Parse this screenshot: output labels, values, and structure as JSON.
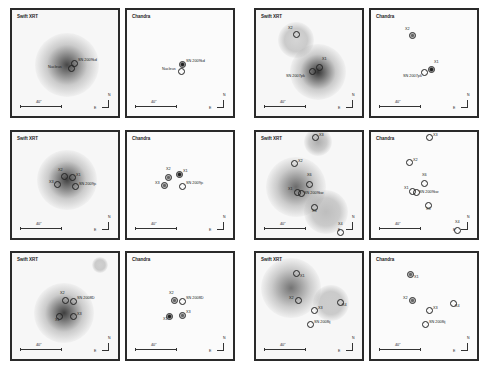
{
  "figure": {
    "scale_label": "40\"",
    "compass": {
      "north": "N",
      "east": "E"
    },
    "panels": [
      {
        "id": "p1",
        "title": "Swift XRT",
        "type": "xrt",
        "x": 10,
        "y": 8,
        "blobs": [
          {
            "x": 55,
            "y": 55,
            "r": 32,
            "c": "rgba(40,40,40,0.85)"
          }
        ],
        "sources": [
          {
            "label": "SN 2009kd",
            "x": 62,
            "y": 53,
            "style": "open",
            "lx": 66,
            "ly": 51
          },
          {
            "label": "Nucleus",
            "x": 59,
            "y": 58,
            "style": "open",
            "lx": 36,
            "ly": 58
          }
        ]
      },
      {
        "id": "p2",
        "title": "Chandra",
        "type": "chandra",
        "x": 125,
        "y": 8,
        "blobs": [],
        "sources": [
          {
            "label": "SN 2009kd",
            "x": 55,
            "y": 54,
            "style": "filled",
            "lx": 59,
            "ly": 52
          },
          {
            "label": "Nucleus",
            "x": 54,
            "y": 61,
            "style": "open",
            "lx": 35,
            "ly": 60
          }
        ]
      },
      {
        "id": "p3",
        "title": "Swift XRT",
        "type": "xrt",
        "x": 254,
        "y": 8,
        "blobs": [
          {
            "x": 62,
            "y": 62,
            "r": 28,
            "c": "rgba(30,30,30,0.9)"
          },
          {
            "x": 40,
            "y": 30,
            "r": 18,
            "c": "rgba(150,150,150,0.35)"
          }
        ],
        "sources": [
          {
            "label": "X2",
            "x": 40,
            "y": 24,
            "style": "open",
            "lx": 32,
            "ly": 19
          },
          {
            "label": "X1",
            "x": 63,
            "y": 57,
            "style": "open",
            "lx": 66,
            "ly": 50
          },
          {
            "label": "SN 2007pk",
            "x": 56,
            "y": 61,
            "style": "open",
            "lx": 30,
            "ly": 67
          }
        ]
      },
      {
        "id": "p4",
        "title": "Chandra",
        "type": "chandra",
        "x": 369,
        "y": 8,
        "blobs": [],
        "sources": [
          {
            "label": "X2",
            "x": 41,
            "y": 25,
            "style": "half",
            "lx": 34,
            "ly": 20
          },
          {
            "label": "X1",
            "x": 60,
            "y": 59,
            "style": "filled",
            "lx": 63,
            "ly": 53
          },
          {
            "label": "SN 2007pk",
            "x": 53,
            "y": 62,
            "style": "open",
            "lx": 32,
            "ly": 67
          }
        ]
      },
      {
        "id": "p5",
        "title": "Swift XRT",
        "type": "xrt",
        "x": 10,
        "y": 130,
        "blobs": [
          {
            "x": 55,
            "y": 48,
            "r": 30,
            "c": "rgba(35,35,35,0.85)"
          }
        ],
        "sources": [
          {
            "label": "X2",
            "x": 52,
            "y": 44,
            "style": "open",
            "lx": 46,
            "ly": 39
          },
          {
            "label": "X1",
            "x": 60,
            "y": 45,
            "style": "open",
            "lx": 64,
            "ly": 44
          },
          {
            "label": "X3",
            "x": 45,
            "y": 52,
            "style": "open",
            "lx": 37,
            "ly": 51
          },
          {
            "label": "SN 2009jc",
            "x": 63,
            "y": 54,
            "style": "open",
            "lx": 67,
            "ly": 53
          }
        ]
      },
      {
        "id": "p6",
        "title": "Chandra",
        "type": "chandra",
        "x": 125,
        "y": 130,
        "blobs": [],
        "sources": [
          {
            "label": "X2",
            "x": 41,
            "y": 45,
            "style": "half",
            "lx": 39,
            "ly": 38
          },
          {
            "label": "X1",
            "x": 52,
            "y": 42,
            "style": "filled",
            "lx": 56,
            "ly": 40
          },
          {
            "label": "X3",
            "x": 37,
            "y": 53,
            "style": "half",
            "lx": 28,
            "ly": 52
          },
          {
            "label": "SN 2009jc",
            "x": 55,
            "y": 54,
            "style": "open",
            "lx": 59,
            "ly": 52
          }
        ]
      },
      {
        "id": "p7",
        "title": "Swift XRT",
        "type": "xrt",
        "x": 254,
        "y": 130,
        "blobs": [
          {
            "x": 40,
            "y": 55,
            "r": 30,
            "c": "rgba(60,60,60,0.75)"
          },
          {
            "x": 62,
            "y": 10,
            "r": 14,
            "c": "rgba(100,100,100,0.5)"
          },
          {
            "x": 70,
            "y": 80,
            "r": 22,
            "c": "rgba(120,120,120,0.45)"
          }
        ],
        "sources": [
          {
            "label": "X3",
            "x": 59,
            "y": 5,
            "style": "open",
            "lx": 63,
            "ly": 4
          },
          {
            "label": "X2",
            "x": 38,
            "y": 31,
            "style": "open",
            "lx": 42,
            "ly": 30
          },
          {
            "label": "X6",
            "x": 53,
            "y": 52,
            "style": "open",
            "lx": 51,
            "ly": 44
          },
          {
            "label": "X1",
            "x": 41,
            "y": 60,
            "style": "open",
            "lx": 32,
            "ly": 58
          },
          {
            "label": "SN 2009kw",
            "x": 45,
            "y": 61,
            "style": "open",
            "lx": 48,
            "ly": 62
          },
          {
            "label": "X5",
            "x": 58,
            "y": 75,
            "style": "open",
            "lx": 56,
            "ly": 80
          },
          {
            "label": "X4",
            "x": 84,
            "y": 100,
            "style": "open",
            "lx": 82,
            "ly": 93
          }
        ]
      },
      {
        "id": "p8",
        "title": "Chandra",
        "type": "chandra",
        "x": 369,
        "y": 130,
        "blobs": [],
        "sources": [
          {
            "label": "X3",
            "x": 58,
            "y": 5,
            "style": "open",
            "lx": 62,
            "ly": 4
          },
          {
            "label": "X2",
            "x": 38,
            "y": 30,
            "style": "open",
            "lx": 42,
            "ly": 29
          },
          {
            "label": "X6",
            "x": 53,
            "y": 51,
            "style": "open",
            "lx": 51,
            "ly": 44
          },
          {
            "label": "X1",
            "x": 41,
            "y": 59,
            "style": "open",
            "lx": 33,
            "ly": 57
          },
          {
            "label": "SN 2009kw",
            "x": 45,
            "y": 60,
            "style": "open",
            "lx": 48,
            "ly": 61
          },
          {
            "label": "X5",
            "x": 57,
            "y": 73,
            "style": "open",
            "lx": 55,
            "ly": 78
          },
          {
            "label": "X4",
            "x": 86,
            "y": 98,
            "style": "open",
            "lx": 84,
            "ly": 91
          }
        ]
      },
      {
        "id": "p9",
        "title": "Swift XRT",
        "type": "xrt",
        "x": 10,
        "y": 251,
        "blobs": [
          {
            "x": 52,
            "y": 60,
            "r": 30,
            "c": "rgba(30,30,30,0.85)"
          },
          {
            "x": 88,
            "y": 12,
            "r": 8,
            "c": "rgba(150,150,150,0.4)"
          }
        ],
        "sources": [
          {
            "label": "X2",
            "x": 53,
            "y": 47,
            "style": "open",
            "lx": 48,
            "ly": 41
          },
          {
            "label": "SN 2008D",
            "x": 61,
            "y": 48,
            "style": "open",
            "lx": 65,
            "ly": 46
          },
          {
            "label": "X1",
            "x": 47,
            "y": 63,
            "style": "open",
            "lx": 43,
            "ly": 68
          },
          {
            "label": "X3",
            "x": 61,
            "y": 63,
            "style": "open",
            "lx": 65,
            "ly": 62
          }
        ]
      },
      {
        "id": "p10",
        "title": "Chandra",
        "type": "chandra",
        "x": 125,
        "y": 251,
        "blobs": [],
        "sources": [
          {
            "label": "X2",
            "x": 47,
            "y": 47,
            "style": "half",
            "lx": 42,
            "ly": 41
          },
          {
            "label": "SN 2008D",
            "x": 55,
            "y": 48,
            "style": "open",
            "lx": 59,
            "ly": 46
          },
          {
            "label": "X1",
            "x": 42,
            "y": 63,
            "style": "filled",
            "lx": 36,
            "ly": 67
          },
          {
            "label": "X3",
            "x": 55,
            "y": 62,
            "style": "half",
            "lx": 59,
            "ly": 60
          }
        ]
      },
      {
        "id": "p11",
        "title": "Swift XRT",
        "type": "xrt",
        "x": 254,
        "y": 251,
        "blobs": [
          {
            "x": 35,
            "y": 35,
            "r": 30,
            "c": "rgba(60,60,60,0.7)"
          },
          {
            "x": 75,
            "y": 50,
            "r": 18,
            "c": "rgba(140,140,140,0.4)"
          }
        ],
        "sources": [
          {
            "label": "X1",
            "x": 40,
            "y": 20,
            "style": "open",
            "lx": 44,
            "ly": 24
          },
          {
            "label": "X2",
            "x": 42,
            "y": 47,
            "style": "open",
            "lx": 33,
            "ly": 46
          },
          {
            "label": "X4",
            "x": 84,
            "y": 49,
            "style": "open",
            "lx": 86,
            "ly": 53
          },
          {
            "label": "X3",
            "x": 58,
            "y": 57,
            "style": "open",
            "lx": 62,
            "ly": 56
          },
          {
            "label": "SN 2008ij",
            "x": 54,
            "y": 71,
            "style": "open",
            "lx": 58,
            "ly": 70
          }
        ]
      },
      {
        "id": "p12",
        "title": "Chandra",
        "type": "chandra",
        "x": 369,
        "y": 251,
        "blobs": [],
        "sources": [
          {
            "label": "X1",
            "x": 39,
            "y": 21,
            "style": "half",
            "lx": 43,
            "ly": 25
          },
          {
            "label": "X2",
            "x": 41,
            "y": 47,
            "style": "half",
            "lx": 32,
            "ly": 46
          },
          {
            "label": "X4",
            "x": 82,
            "y": 50,
            "style": "open",
            "lx": 84,
            "ly": 54
          },
          {
            "label": "X3",
            "x": 58,
            "y": 57,
            "style": "open",
            "lx": 62,
            "ly": 56
          },
          {
            "label": "SN 2008ij",
            "x": 54,
            "y": 71,
            "style": "open",
            "lx": 58,
            "ly": 70
          }
        ]
      }
    ]
  }
}
